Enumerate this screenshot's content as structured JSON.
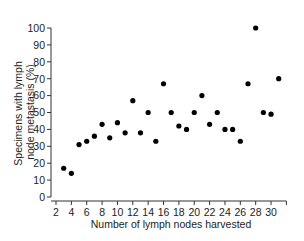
{
  "chart_data": {
    "type": "scatter",
    "title": "",
    "xlabel": "Number of lymph nodes harvested",
    "ylabel_lines": [
      "Specimens with lymph",
      "node metastasis (%)"
    ],
    "ylabel": "Specimens with lymph node metastasis (%)",
    "xlim": [
      2,
      32
    ],
    "ylim": [
      0,
      100
    ],
    "x_ticks": [
      2,
      4,
      6,
      8,
      10,
      12,
      14,
      16,
      18,
      20,
      22,
      24,
      26,
      28,
      30
    ],
    "x_minor_ticks": [
      32
    ],
    "y_ticks": [
      0,
      10,
      20,
      30,
      40,
      50,
      60,
      70,
      80,
      90,
      100
    ],
    "grid": false,
    "legend": null,
    "marker_color": "#000000",
    "points": [
      {
        "x": 3,
        "y": 17
      },
      {
        "x": 4,
        "y": 14
      },
      {
        "x": 5,
        "y": 31
      },
      {
        "x": 6,
        "y": 33
      },
      {
        "x": 7,
        "y": 36
      },
      {
        "x": 8,
        "y": 43
      },
      {
        "x": 9,
        "y": 35
      },
      {
        "x": 10,
        "y": 44
      },
      {
        "x": 11,
        "y": 38
      },
      {
        "x": 12,
        "y": 57
      },
      {
        "x": 13,
        "y": 38
      },
      {
        "x": 14,
        "y": 50
      },
      {
        "x": 15,
        "y": 33
      },
      {
        "x": 16,
        "y": 67
      },
      {
        "x": 17,
        "y": 50
      },
      {
        "x": 18,
        "y": 42
      },
      {
        "x": 19,
        "y": 40
      },
      {
        "x": 20,
        "y": 50
      },
      {
        "x": 21,
        "y": 60
      },
      {
        "x": 22,
        "y": 43
      },
      {
        "x": 23,
        "y": 50
      },
      {
        "x": 24,
        "y": 40
      },
      {
        "x": 25,
        "y": 40
      },
      {
        "x": 26,
        "y": 33
      },
      {
        "x": 27,
        "y": 67
      },
      {
        "x": 28,
        "y": 100
      },
      {
        "x": 29,
        "y": 50
      },
      {
        "x": 30,
        "y": 49
      },
      {
        "x": 31,
        "y": 70
      }
    ]
  }
}
